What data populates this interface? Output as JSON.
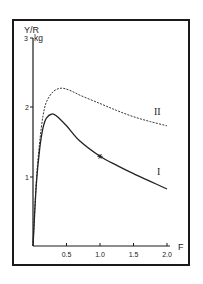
{
  "chart_data": {
    "type": "line",
    "title": "",
    "xlabel": "F",
    "ylabel": "Y/R",
    "yunit": "kg",
    "xlim": [
      0,
      2.0
    ],
    "ylim": [
      0,
      3
    ],
    "grid": false,
    "legend": "inline labels at curve ends",
    "x_ticks": [
      "0.5",
      "1.0",
      "1.5",
      "2.0"
    ],
    "y_ticks": [
      "1",
      "2",
      "3"
    ],
    "series": [
      {
        "name": "I",
        "style": "solid",
        "x": [
          0,
          0.05,
          0.1,
          0.15,
          0.2,
          0.28,
          0.35,
          0.5,
          0.7,
          1.0,
          1.25,
          1.5,
          1.75,
          2.0
        ],
        "values": [
          0,
          0.9,
          1.4,
          1.7,
          1.84,
          1.9,
          1.87,
          1.73,
          1.51,
          1.29,
          1.16,
          1.04,
          0.93,
          0.82
        ]
      },
      {
        "name": "II",
        "style": "dashed",
        "x": [
          0,
          0.05,
          0.1,
          0.15,
          0.2,
          0.3,
          0.42,
          0.55,
          0.7,
          1.0,
          1.25,
          1.5,
          1.75,
          2.0
        ],
        "values": [
          0,
          0.95,
          1.5,
          1.87,
          2.07,
          2.22,
          2.27,
          2.24,
          2.17,
          2.05,
          1.95,
          1.86,
          1.79,
          1.73
        ]
      }
    ],
    "annotations": [
      {
        "type": "star-marker",
        "series": "I",
        "x": 1.0,
        "y": 1.29
      }
    ]
  },
  "labels": {
    "y_axis": "Y/R",
    "y_unit": "kg",
    "x_axis": "F",
    "series_I": "I",
    "series_II": "II",
    "tick_x_0_5": "0.5",
    "tick_x_1_0": "1.0",
    "tick_x_1_5": "1.5",
    "tick_x_2_0": "2.0",
    "tick_y_1": "1",
    "tick_y_2": "2",
    "tick_y_3": "3"
  }
}
